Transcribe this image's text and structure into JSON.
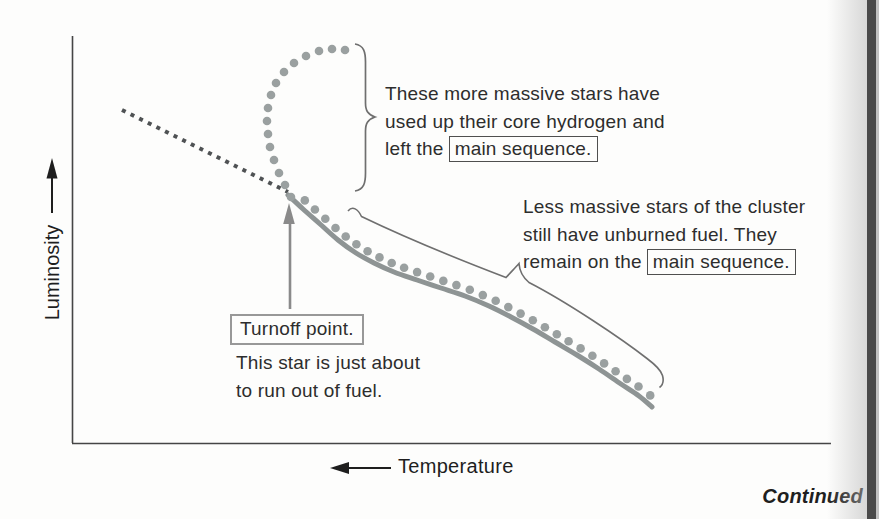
{
  "axes": {
    "y_label": "Luminosity",
    "x_label": "Temperature"
  },
  "annotations": {
    "massive": {
      "line1": "These more massive stars have",
      "line2": "used up their core hydrogen and",
      "line3_prefix": "left the",
      "boxed": "main sequence."
    },
    "less_massive": {
      "line1": "Less massive stars of the cluster",
      "line2": "still have unburned fuel. They",
      "line3_prefix": "remain on the",
      "boxed": "main sequence."
    },
    "turnoff": {
      "boxed": "Turnoff point.",
      "line1": "This star is just about",
      "line2": "to run out of fuel."
    }
  },
  "footer": {
    "continued": "Continued"
  },
  "colors": {
    "axis": "#454545",
    "dashed_curve": "#4f5254",
    "solid_curve": "#8e9494",
    "dots": "#9aa0a0",
    "brace": "#6f6f6f",
    "gray_arrow": "#8a8a8a",
    "black_arrow": "#1e1e1e",
    "page_edge": "#4a4a4a"
  },
  "curves": {
    "dashed_pre_turnoff": [
      [
        122,
        110
      ],
      [
        288,
        192
      ]
    ],
    "main_sequence": [
      [
        288,
        195
      ],
      [
        303,
        209
      ],
      [
        320,
        224
      ],
      [
        338,
        240
      ],
      [
        356,
        253
      ],
      [
        374,
        263
      ],
      [
        394,
        272
      ],
      [
        417,
        280
      ],
      [
        441,
        288
      ],
      [
        465,
        296
      ],
      [
        489,
        306
      ],
      [
        511,
        317
      ],
      [
        533,
        329
      ],
      [
        555,
        342
      ],
      [
        577,
        355
      ],
      [
        599,
        369
      ],
      [
        621,
        384
      ],
      [
        639,
        396
      ],
      [
        652,
        407
      ]
    ],
    "giant_branch_dots": [
      [
        291,
        197
      ],
      [
        285,
        185
      ],
      [
        279,
        173
      ],
      [
        274,
        160
      ],
      [
        270,
        147
      ],
      [
        268,
        134
      ],
      [
        267,
        121
      ],
      [
        268,
        108
      ],
      [
        271,
        95
      ],
      [
        276,
        83
      ],
      [
        284,
        72
      ],
      [
        294,
        63
      ],
      [
        306,
        56
      ],
      [
        319,
        51
      ],
      [
        332,
        49
      ],
      [
        345,
        50
      ]
    ],
    "dot_radius": 4.3,
    "ms_dot_spacing": 13.8,
    "ms_dot_offset": 7.5
  }
}
